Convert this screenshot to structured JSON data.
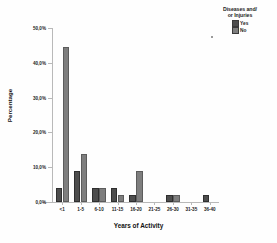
{
  "chart_data": {
    "type": "bar",
    "title": "",
    "xlabel": "Years of Activity",
    "ylabel": "Percentage",
    "categories": [
      "<1",
      "1-5",
      "6-10",
      "11-15",
      "16-20",
      "21-25",
      "26-30",
      "31-35",
      "36-40"
    ],
    "series": [
      {
        "name": "Yes",
        "color": "#4d4d4d",
        "values": [
          3.9,
          8.8,
          3.9,
          3.9,
          2.0,
          0.0,
          2.0,
          0.0,
          2.0
        ]
      },
      {
        "name": "No",
        "color": "#7e7e7e",
        "values": [
          44.6,
          13.7,
          3.9,
          2.0,
          8.8,
          0.0,
          2.0,
          0.0,
          0.0
        ]
      }
    ],
    "ylim": [
      0,
      50
    ],
    "ytick_values": [
      0,
      10,
      20,
      30,
      40,
      50
    ],
    "ytick_labels": [
      "0,0%",
      "10,0%",
      "20,0%",
      "30,0%",
      "40,0%",
      "50,0%"
    ],
    "grid": false,
    "legend_position": "top-right"
  },
  "legend": {
    "title_line1": "Diseases and/",
    "title_line2": "or Injuries",
    "items": [
      {
        "label": "Yes",
        "color": "#4d4d4d"
      },
      {
        "label": "No",
        "color": "#7e7e7e"
      }
    ]
  },
  "axes": {
    "y_title": "Percentage",
    "x_title": "Years of Activity"
  }
}
